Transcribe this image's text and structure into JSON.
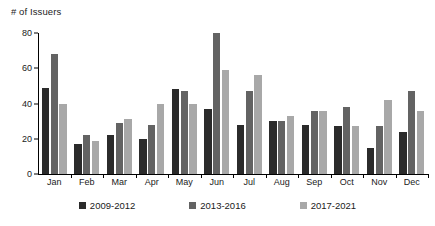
{
  "chart_data": {
    "type": "bar",
    "title": "# of Issuers",
    "xlabel": "",
    "ylabel": "# of Issuers",
    "ylim": [
      0,
      80
    ],
    "yticks": [
      0,
      20,
      40,
      60,
      80
    ],
    "grid": false,
    "legend_position": "bottom",
    "categories": [
      "Jan",
      "Feb",
      "Mar",
      "Apr",
      "May",
      "Jun",
      "Jul",
      "Aug",
      "Sep",
      "Oct",
      "Nov",
      "Dec"
    ],
    "series": [
      {
        "name": "2009-2012",
        "color": "#2b2b2b",
        "values": [
          49,
          17,
          22,
          20,
          48,
          37,
          28,
          30,
          28,
          27,
          15,
          24
        ]
      },
      {
        "name": "2013-2016",
        "color": "#636363",
        "values": [
          68,
          22,
          29,
          28,
          47,
          80,
          47,
          30,
          36,
          38,
          27,
          47
        ]
      },
      {
        "name": "2017-2021",
        "color": "#a8a8a8",
        "values": [
          40,
          19,
          31,
          40,
          40,
          59,
          56,
          33,
          36,
          27,
          42,
          36
        ]
      }
    ]
  }
}
